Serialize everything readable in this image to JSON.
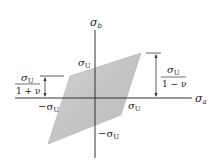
{
  "diagram": {
    "axes": {
      "vertical_label": "σ",
      "vertical_sub": "b",
      "horizontal_label": "σ",
      "horizontal_sub": "a"
    },
    "labels": {
      "top_sigma": "σ",
      "top_sub": "U",
      "left_neg": "−σ",
      "left_sub": "U",
      "right_sigma": "σ",
      "right_sub": "U",
      "bottom_neg": "−σ",
      "bottom_sub": "U"
    },
    "left_fraction": {
      "numerator": "σ",
      "numerator_sub": "U",
      "denominator": "1 + ν"
    },
    "right_fraction": {
      "numerator": "σ",
      "numerator_sub": "U",
      "denominator": "1 − ν"
    },
    "colors": {
      "region_fill": "#c8c8c8",
      "axis": "#333333"
    }
  }
}
